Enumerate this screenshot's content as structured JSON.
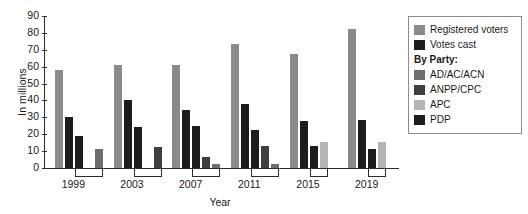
{
  "chart_data": {
    "type": "bar",
    "title": "",
    "xlabel": "Year",
    "ylabel": "In millions",
    "categories": [
      "1999",
      "2003",
      "2007",
      "2011",
      "2015",
      "2019"
    ],
    "ylim": [
      0,
      90
    ],
    "yticks": [
      0,
      10,
      20,
      30,
      40,
      50,
      60,
      70,
      80,
      90
    ],
    "grid": false,
    "legend_position": "right",
    "legend_heading": "By Party:",
    "series": [
      {
        "name": "Registered voters",
        "color": "#8a8a8a",
        "values": [
          57.9,
          60.8,
          61.2,
          73.2,
          67.4,
          82.3
        ]
      },
      {
        "name": "Votes cast",
        "color": "#1c1c1c",
        "values": [
          30.3,
          40.4,
          34.5,
          38.2,
          28.0,
          28.6
        ]
      },
      {
        "name": "AD/AC/ACN",
        "color": "#6e6e6e",
        "values": [
          11.1,
          null,
          2.6,
          2.1,
          null,
          null
        ]
      },
      {
        "name": "ANPP/CPC",
        "color": "#3f3f3f",
        "values": [
          null,
          12.5,
          6.6,
          12.9,
          null,
          null
        ]
      },
      {
        "name": "APC",
        "color": "#b5b5b5",
        "values": [
          null,
          null,
          null,
          null,
          15.4,
          15.2
        ]
      },
      {
        "name": "PDP",
        "color": "#1c1c1c",
        "values": [
          18.7,
          24.3,
          24.6,
          22.5,
          12.9,
          11.0
        ]
      }
    ],
    "groups": [
      {
        "year": "1999",
        "bars": [
          {
            "series": "Registered voters",
            "value": 57.9,
            "color": "#8a8a8a"
          },
          {
            "series": "Votes cast",
            "value": 30.3,
            "color": "#1c1c1c"
          },
          {
            "series": "PDP",
            "value": 18.7,
            "color": "#1c1c1c"
          },
          {
            "series": "AD/AC/ACN",
            "value": 11.1,
            "color": "#6e6e6e",
            "slot": 4
          }
        ]
      },
      {
        "year": "2003",
        "bars": [
          {
            "series": "Registered voters",
            "value": 60.8,
            "color": "#8a8a8a"
          },
          {
            "series": "Votes cast",
            "value": 40.4,
            "color": "#1c1c1c"
          },
          {
            "series": "PDP",
            "value": 24.3,
            "color": "#1c1c1c"
          },
          {
            "series": "ANPP/CPC",
            "value": 12.5,
            "color": "#3f3f3f",
            "slot": 4
          }
        ]
      },
      {
        "year": "2007",
        "bars": [
          {
            "series": "Registered voters",
            "value": 61.2,
            "color": "#8a8a8a"
          },
          {
            "series": "Votes cast",
            "value": 34.5,
            "color": "#1c1c1c"
          },
          {
            "series": "PDP",
            "value": 24.6,
            "color": "#1c1c1c"
          },
          {
            "series": "ANPP/CPC",
            "value": 6.6,
            "color": "#3f3f3f"
          },
          {
            "series": "AD/AC/ACN",
            "value": 2.6,
            "color": "#6e6e6e"
          }
        ]
      },
      {
        "year": "2011",
        "bars": [
          {
            "series": "Registered voters",
            "value": 73.2,
            "color": "#8a8a8a"
          },
          {
            "series": "Votes cast",
            "value": 38.2,
            "color": "#1c1c1c"
          },
          {
            "series": "PDP",
            "value": 22.5,
            "color": "#1c1c1c"
          },
          {
            "series": "ANPP/CPC",
            "value": 12.9,
            "color": "#3f3f3f"
          },
          {
            "series": "AD/AC/ACN",
            "value": 2.1,
            "color": "#6e6e6e"
          }
        ]
      },
      {
        "year": "2015",
        "bars": [
          {
            "series": "Registered voters",
            "value": 67.4,
            "color": "#8a8a8a"
          },
          {
            "series": "Votes cast",
            "value": 28.0,
            "color": "#1c1c1c"
          },
          {
            "series": "PDP",
            "value": 12.9,
            "color": "#1c1c1c"
          },
          {
            "series": "APC",
            "value": 15.4,
            "color": "#b5b5b5"
          }
        ]
      },
      {
        "year": "2019",
        "bars": [
          {
            "series": "Registered voters",
            "value": 82.3,
            "color": "#8a8a8a"
          },
          {
            "series": "Votes cast",
            "value": 28.6,
            "color": "#1c1c1c"
          },
          {
            "series": "PDP",
            "value": 11.0,
            "color": "#1c1c1c"
          },
          {
            "series": "APC",
            "value": 15.2,
            "color": "#b5b5b5"
          }
        ]
      }
    ]
  },
  "legend": {
    "heading": "By Party:",
    "items": [
      {
        "label": "Registered voters",
        "color": "#8a8a8a"
      },
      {
        "label": "Votes cast",
        "color": "#1c1c1c"
      },
      {
        "label": "AD/AC/ACN",
        "color": "#6e6e6e"
      },
      {
        "label": "ANPP/CPC",
        "color": "#3f3f3f"
      },
      {
        "label": "APC",
        "color": "#b5b5b5"
      },
      {
        "label": "PDP",
        "color": "#1c1c1c"
      }
    ]
  },
  "axes": {
    "ylabel": "In millions",
    "xlabel": "Year"
  }
}
